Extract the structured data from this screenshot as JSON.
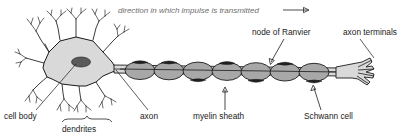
{
  "figure": {
    "title_note": "direction in which impulse is transmitted",
    "type": "labeled-biological-diagram"
  },
  "labels": {
    "direction": "direction in which impulse is transmitted",
    "node_of_ranvier": "node of Ranvier",
    "axon_terminals": "axon terminals",
    "cell_body": "cell body",
    "dendrites": "dendrites",
    "axon": "axon",
    "myelin_sheath": "myelin sheath",
    "schwann_cell": "Schwann cell"
  },
  "colors": {
    "background": "#ffffff",
    "soma_fill": "#d9d9d9",
    "nucleus_fill": "#5a5a5a",
    "myelin_fill": "#a8a8a8",
    "schwann_cap": "#1f1f1f",
    "outline": "#1a1a1a",
    "label_text": "#1a1a1a",
    "italic_text": "#6e6e6e"
  },
  "structure": {
    "myelin_segment_count": 7,
    "terminal_branch_count": 4,
    "dendrite_count": 8,
    "impulse_direction": "left-to-right"
  }
}
